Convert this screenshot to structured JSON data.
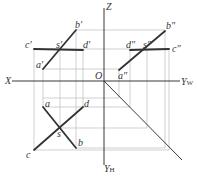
{
  "diagram": {
    "type": "orthographic-projection",
    "axes": {
      "X": "X",
      "Z": "Z",
      "O": "O",
      "YW": "Y",
      "YW_sub": "W",
      "YH": "Y",
      "YH_sub": "H"
    },
    "front_view": {
      "a": "a′",
      "b": "b′",
      "c": "c′",
      "d": "d′",
      "s": "s′"
    },
    "side_view": {
      "a": "a″",
      "b": "b″",
      "c": "c″",
      "d": "d″",
      "s": "s″"
    },
    "top_view": {
      "a": "a",
      "b": "b",
      "c": "c",
      "d": "d",
      "s": "s"
    },
    "colors": {
      "thick_line": "#333333",
      "axis_line": "#222222",
      "projection_line": "#bbbbbb"
    }
  }
}
